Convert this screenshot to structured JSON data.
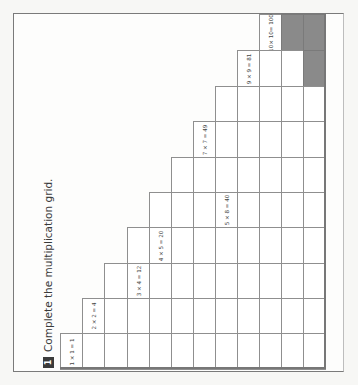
{
  "exercise": {
    "number": "1",
    "instruction": "Complete the multiplication grid."
  },
  "grid": {
    "columns": 12,
    "rows": 10,
    "col_x": [
      60,
      82,
      104,
      127,
      149,
      171,
      193,
      215,
      237,
      259,
      281,
      303,
      325
    ],
    "row_y": [
      14,
      50,
      86,
      121,
      157,
      192,
      227,
      263,
      298,
      333,
      369
    ],
    "column_start_row": [
      10,
      9,
      8,
      7,
      6,
      5,
      4,
      3,
      2,
      1,
      1,
      1
    ],
    "shaded_cells": [
      [
        11,
        1
      ],
      [
        12,
        1
      ],
      [
        12,
        2
      ]
    ],
    "colors": {
      "shaded": "#8a8a8a",
      "line": "#8f8f8f",
      "cell": "#ffffff"
    },
    "filled_examples": [
      {
        "col": 1,
        "row": 10,
        "text": "1 × 1 = 1"
      },
      {
        "col": 2,
        "row": 9,
        "text": "2 × 2 = 4"
      },
      {
        "col": 4,
        "row": 8,
        "text": "3 × 4 = 12"
      },
      {
        "col": 5,
        "row": 7,
        "text": "4 × 5 = 20"
      },
      {
        "col": 8,
        "row": 6,
        "text": "5 × 8 = 40"
      },
      {
        "col": 7,
        "row": 4,
        "text": "7 × 7 = 49"
      },
      {
        "col": 9,
        "row": 2,
        "text": "9 × 9 = 81"
      },
      {
        "col": 10,
        "row": 1,
        "text": "10× 10= 100"
      }
    ]
  }
}
